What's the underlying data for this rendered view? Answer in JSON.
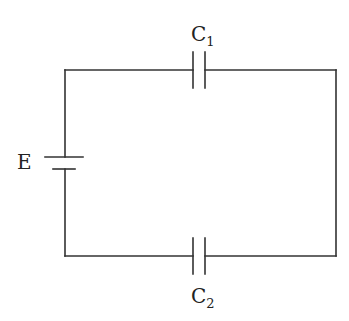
{
  "diagram": {
    "type": "circuit",
    "title": "",
    "stroke_color": "#333333",
    "components": [
      {
        "id": "E",
        "kind": "battery",
        "label": "E"
      },
      {
        "id": "C1",
        "kind": "capacitor",
        "label_main": "C",
        "label_sub": "1",
        "position": "top"
      },
      {
        "id": "C2",
        "kind": "capacitor",
        "label_main": "C",
        "label_sub": "2",
        "position": "bottom"
      }
    ],
    "connections": [
      [
        "E+",
        "C1"
      ],
      [
        "C1",
        "C2"
      ],
      [
        "C2",
        "E-"
      ]
    ]
  }
}
